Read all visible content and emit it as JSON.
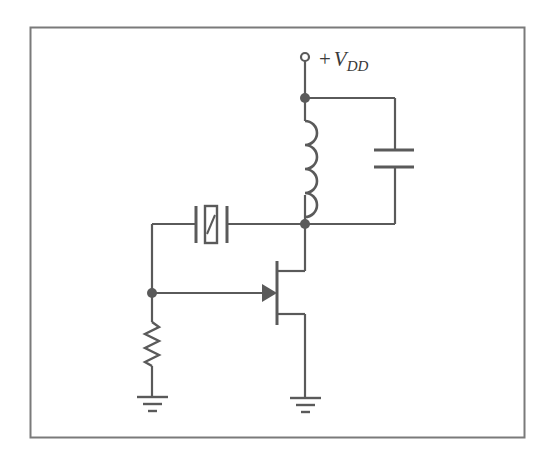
{
  "diagram": {
    "colors": {
      "stroke": "#5a5a5a",
      "frame": "#7a7a7a",
      "node": "#5a5a5a",
      "background": "#ffffff"
    },
    "supply_label": {
      "plus": "+",
      "symbol": "V",
      "subscript": "DD"
    },
    "components": [
      {
        "id": "supply-terminal",
        "type": "terminal",
        "label": "+V_DD"
      },
      {
        "id": "inductor",
        "type": "inductor",
        "turns": 4
      },
      {
        "id": "capacitor",
        "type": "capacitor"
      },
      {
        "id": "crystal",
        "type": "crystal"
      },
      {
        "id": "jfet",
        "type": "n-channel JFET"
      },
      {
        "id": "resistor",
        "type": "resistor"
      },
      {
        "id": "ground-1",
        "type": "ground"
      },
      {
        "id": "ground-2",
        "type": "ground"
      }
    ],
    "nodes": [
      "vdd-junction",
      "drain-junction",
      "gate-junction"
    ]
  }
}
